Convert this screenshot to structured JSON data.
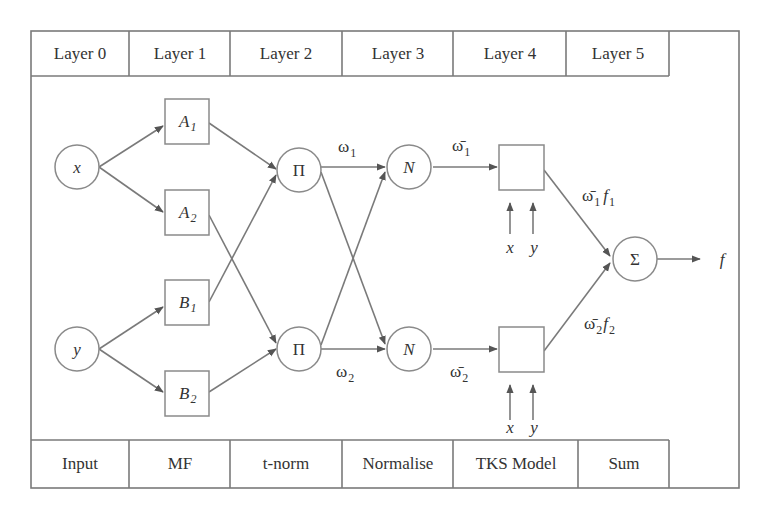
{
  "header": {
    "cells": [
      "Layer 0",
      "Layer 1",
      "Layer 2",
      "Layer 3",
      "Layer 4",
      "Layer 5"
    ]
  },
  "footer": {
    "cells": [
      "Input",
      "MF",
      "t-norm",
      "Normalise",
      "TKS Model",
      "Sum"
    ]
  },
  "nodes": {
    "input_x": "x",
    "input_y": "y",
    "mf_a1": {
      "base": "A",
      "sub": "1"
    },
    "mf_a2": {
      "base": "A",
      "sub": "2"
    },
    "mf_b1": {
      "base": "B",
      "sub": "1"
    },
    "mf_b2": {
      "base": "B",
      "sub": "2"
    },
    "tnorm_1": "Π",
    "tnorm_2": "Π",
    "norm_1": "N",
    "norm_2": "N",
    "sum": "Σ",
    "output": "f"
  },
  "edge_labels": {
    "w1": {
      "base": "ω",
      "sub": "1"
    },
    "w2": {
      "base": "ω",
      "sub": "2"
    },
    "w1_bar": {
      "base": "ω̄",
      "sub": "1"
    },
    "w2_bar": {
      "base": "ω̄",
      "sub": "2"
    },
    "w1f1": {
      "base": "ω̄",
      "sub": "1",
      "f": "f",
      "fsub": "1"
    },
    "w2f2": {
      "base": "ω̄",
      "sub": "2",
      "f": "f",
      "fsub": "2"
    }
  },
  "tks_inputs": {
    "top": [
      "x",
      "y"
    ],
    "bottom": [
      "x",
      "y"
    ]
  },
  "colors": {
    "stroke": "#7a7a7a",
    "text": "#333333",
    "background": "#ffffff"
  }
}
